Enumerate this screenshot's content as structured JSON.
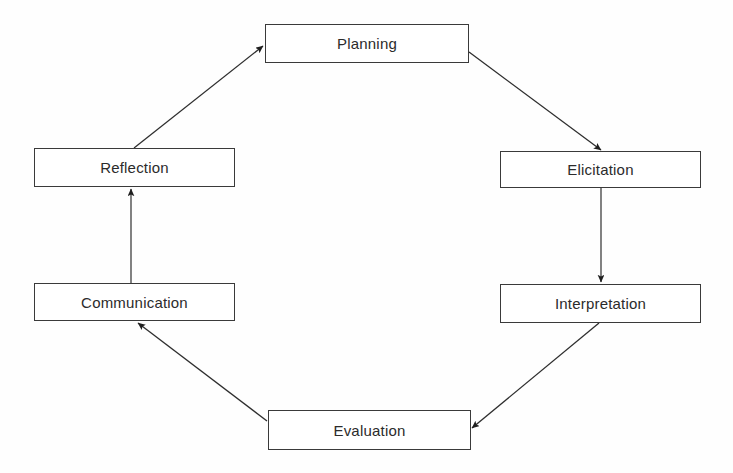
{
  "diagram": {
    "type": "cycle-flowchart",
    "background_color": "#fefefe",
    "stroke_color": "#3a3a3a",
    "text_color": "#2b2b2b",
    "nodes": [
      {
        "id": "planning",
        "label": "Planning",
        "x": 265,
        "y": 24,
        "width": 204,
        "height": 39
      },
      {
        "id": "elicitation",
        "label": "Elicitation",
        "x": 500,
        "y": 151,
        "width": 201,
        "height": 37
      },
      {
        "id": "interpretation",
        "label": "Interpretation",
        "x": 500,
        "y": 284,
        "width": 201,
        "height": 39
      },
      {
        "id": "evaluation",
        "label": "Evaluation",
        "x": 268,
        "y": 410,
        "width": 203,
        "height": 40
      },
      {
        "id": "communication",
        "label": "Communication",
        "x": 34,
        "y": 283,
        "width": 201,
        "height": 38
      },
      {
        "id": "reflection",
        "label": "Reflection",
        "x": 34,
        "y": 148,
        "width": 201,
        "height": 39
      }
    ],
    "edges": [
      {
        "id": "reflection-to-planning",
        "from": "reflection",
        "to": "planning",
        "kind": "diagonal",
        "x1": 134,
        "y1": 148,
        "x2": 263,
        "y2": 46
      },
      {
        "id": "planning-to-elicitation",
        "from": "planning",
        "to": "elicitation",
        "kind": "diagonal",
        "x1": 469,
        "y1": 52,
        "x2": 601,
        "y2": 150
      },
      {
        "id": "elicitation-to-interpretation",
        "from": "elicitation",
        "to": "interpretation",
        "kind": "vertical",
        "x1": 601,
        "y1": 188,
        "x2": 601,
        "y2": 282
      },
      {
        "id": "interpretation-to-evaluation",
        "from": "interpretation",
        "to": "evaluation",
        "kind": "diagonal",
        "x1": 599,
        "y1": 323,
        "x2": 472,
        "y2": 428
      },
      {
        "id": "evaluation-to-communication",
        "from": "evaluation",
        "to": "communication",
        "kind": "diagonal",
        "x1": 267,
        "y1": 421,
        "x2": 138,
        "y2": 323
      },
      {
        "id": "communication-to-reflection",
        "from": "communication",
        "to": "reflection",
        "kind": "vertical",
        "x1": 131,
        "y1": 283,
        "x2": 131,
        "y2": 189
      }
    ]
  }
}
